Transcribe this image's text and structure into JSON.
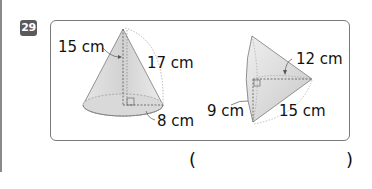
{
  "problem": {
    "number": "29"
  },
  "figures": [
    {
      "name": "cone-upright",
      "labels": {
        "slant_left": "15 cm",
        "slant_right": "17 cm",
        "radius": "8 cm"
      }
    },
    {
      "name": "cone-tilted",
      "labels": {
        "height": "12 cm",
        "radius": "9 cm",
        "slant": "15 cm"
      }
    }
  ],
  "answer": {
    "open_paren": "(",
    "close_paren": ")",
    "value": ""
  }
}
